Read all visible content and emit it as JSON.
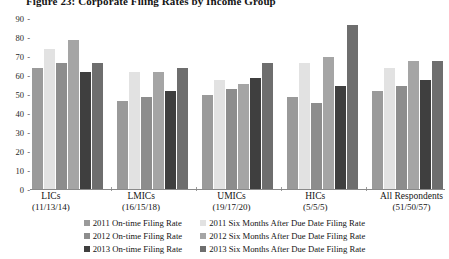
{
  "chart_data": {
    "type": "bar",
    "title": "Figure 23: Corporate Filing Rates by Income Group",
    "xlabel": "",
    "ylabel": "",
    "ylim": [
      0,
      90
    ],
    "yticks": [
      0,
      10,
      20,
      30,
      40,
      50,
      60,
      70,
      80,
      90
    ],
    "grid": false,
    "legend_position": "bottom",
    "categories": [
      "LICs",
      "LMICs",
      "UMICs",
      "HICs",
      "All Respondents"
    ],
    "category_sublabels": [
      "(11/13/14)",
      "(16/15/18)",
      "(19/17/20)",
      "(5/5/5)",
      "(51/50/57)"
    ],
    "series": [
      {
        "name": "2011 On-time Filing Rate",
        "color": "#9a9a9a",
        "values": [
          64,
          47,
          50,
          49,
          52
        ]
      },
      {
        "name": "2011 Six Months After Due Date Filing Rate",
        "color": "#e2e2e2",
        "values": [
          74,
          62,
          58,
          67,
          64
        ]
      },
      {
        "name": "2012 On-time Filing Rate",
        "color": "#8d8d8d",
        "values": [
          67,
          49,
          53,
          46,
          55
        ]
      },
      {
        "name": "2012 Six Months After Due Date Filing Rate",
        "color": "#a5a5a5",
        "values": [
          79,
          62,
          56,
          70,
          68
        ]
      },
      {
        "name": "2013 On-time Filing Rate",
        "color": "#3f3f3f",
        "values": [
          62,
          52,
          59,
          55,
          58
        ]
      },
      {
        "name": "2013 Six Months After Due Date Filing Rate",
        "color": "#6e6e6e",
        "values": [
          67,
          64,
          67,
          87,
          68
        ]
      }
    ]
  },
  "legend": {
    "left_column": [
      "2011 On-time Filing Rate",
      "2012 On-time Filing Rate",
      "2013 On-time Filing Rate"
    ],
    "right_column": [
      "2011 Six Months After Due Date Filing Rate",
      "2012 Six Months After Due Date Filing Rate",
      "2013 Six Months After Due Date Filing Rate"
    ]
  }
}
